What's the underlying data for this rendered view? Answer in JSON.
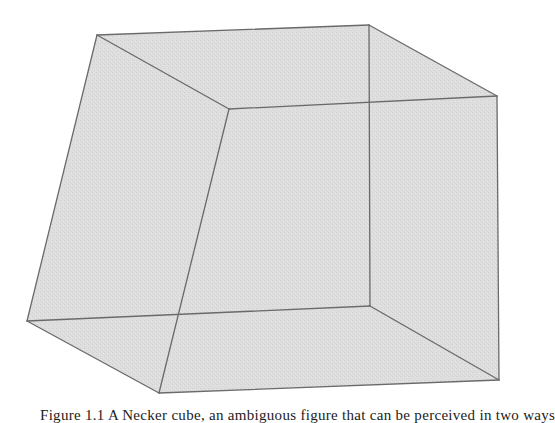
{
  "figure": {
    "type": "wireframe-cube",
    "fill_color": "#dcdcdc",
    "edge_color": "#6a6a6a",
    "vertices": {
      "front_top_left": [
        229,
        109
      ],
      "front_top_right": [
        497,
        96
      ],
      "front_bottom_left": [
        159,
        393
      ],
      "front_bottom_right": [
        499,
        380
      ],
      "back_top_left": [
        97,
        35
      ],
      "back_top_right": [
        369,
        25
      ],
      "back_bottom_left": [
        27,
        321
      ],
      "back_bottom_right": [
        370,
        306
      ]
    }
  },
  "caption": {
    "text": "Figure 1.1 A Necker cube, an ambiguous figure that can be perceived in two ways"
  }
}
